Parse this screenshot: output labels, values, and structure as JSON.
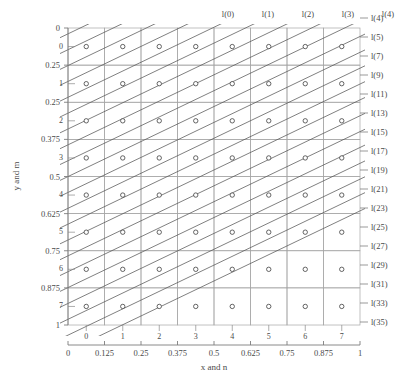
{
  "chart_data": {
    "type": "scatter",
    "title": "",
    "xlabel": "x and n",
    "ylabel": "y and m",
    "xlim": [
      0,
      1
    ],
    "ylim": [
      0,
      1
    ],
    "grid": true,
    "legend_position": "none",
    "x_tick_labels": [
      "0",
      "0.125",
      "0.25",
      "0.375",
      "0.5",
      "0.625",
      "0.75",
      "0.875",
      "1"
    ],
    "x_tick_values": [
      0,
      0.125,
      0.25,
      0.375,
      0.5,
      0.625,
      0.75,
      0.875,
      1
    ],
    "y_tick_labels": [
      "0",
      "0.25",
      "0.25",
      "0.375",
      "0.5",
      "0.625",
      "0.75",
      "0.875",
      "1"
    ],
    "y_tick_values": [
      0,
      0.125,
      0.25,
      0.375,
      0.5,
      0.625,
      0.75,
      0.875,
      1
    ],
    "inner_col_labels": [
      "0",
      "1",
      "2",
      "3",
      "4",
      "5",
      "6",
      "7"
    ],
    "inner_row_labels": [
      "0",
      "1",
      "2",
      "3",
      "4",
      "5",
      "6",
      "7"
    ],
    "top_labels": [
      "l(0)",
      "l(1)",
      "l(2)",
      "l(3)",
      "l(4)"
    ],
    "right_labels": [
      "l(4)",
      "l(5)",
      "l(7)",
      "l(9)",
      "l(11)",
      "l(13)",
      "l(15)",
      "l(17)",
      "l(19)",
      "l(21)",
      "l(23)",
      "l(25)",
      "l(27)",
      "l(29)",
      "l(31)",
      "l(33)",
      "l(35)"
    ],
    "n_cols": 8,
    "n_rows": 8,
    "marker": "circle-open",
    "marker_count": 64,
    "diagonal_line_count": 22,
    "diagonal_slope_note": "constant positive slope family fanning from top-left corner",
    "colors": {
      "grid": "#b9b9b9",
      "cell_border": "#9a9a9a",
      "diagonal": "#555555",
      "marker": "#444444",
      "axis": "#7d7d7d",
      "text": "#4a4a4a",
      "background": "#ffffff"
    }
  }
}
